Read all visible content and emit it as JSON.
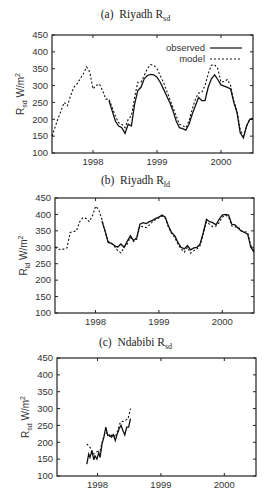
{
  "figure": {
    "panels": [
      {
        "id": "a",
        "label": "(a)",
        "site": "Riyadh",
        "var_main": "R",
        "var_sub": "sd"
      },
      {
        "id": "b",
        "label": "(b)",
        "site": "Riyadh",
        "var_main": "R",
        "var_sub": "ld"
      },
      {
        "id": "c",
        "label": "(c)",
        "site": "Ndabibi",
        "var_main": "R",
        "var_sub": "sd"
      }
    ],
    "legend": {
      "observed": "observed",
      "model": "model"
    },
    "ylabel_units": "W/m",
    "ylabel_sup": "2"
  },
  "chart_data": [
    {
      "type": "line",
      "title": "(a) Riyadh Rsd",
      "xlabel": "",
      "ylabel": "Rsd W/m2",
      "xlim": [
        1997.36,
        2000.5
      ],
      "ylim": [
        100,
        450
      ],
      "xticks": [
        1998,
        1999,
        2000
      ],
      "yticks": [
        100,
        150,
        200,
        250,
        300,
        350,
        400,
        450
      ],
      "grid": false,
      "legend_position": "upper right",
      "series": [
        {
          "name": "observed",
          "style": "solid",
          "x": [
            1998.25,
            1998.3,
            1998.35,
            1998.4,
            1998.45,
            1998.5,
            1998.55,
            1998.6,
            1998.65,
            1998.7,
            1998.75,
            1998.8,
            1998.85,
            1998.9,
            1998.95,
            1999.0,
            1999.05,
            1999.1,
            1999.15,
            1999.2,
            1999.25,
            1999.3,
            1999.35,
            1999.4,
            1999.45,
            1999.5,
            1999.55,
            1999.6,
            1999.65,
            1999.7,
            1999.75,
            1999.8,
            1999.85,
            1999.9,
            1999.95,
            2000.0,
            2000.05,
            2000.1,
            2000.15,
            2000.2,
            2000.25,
            2000.3,
            2000.35,
            2000.4,
            2000.45,
            2000.5
          ],
          "y": [
            255,
            225,
            195,
            180,
            175,
            158,
            185,
            180,
            245,
            285,
            295,
            320,
            330,
            333,
            332,
            325,
            310,
            290,
            270,
            250,
            225,
            195,
            175,
            172,
            168,
            185,
            215,
            240,
            265,
            255,
            255,
            295,
            320,
            332,
            318,
            302,
            298,
            295,
            290,
            250,
            220,
            160,
            145,
            180,
            200,
            202
          ]
        },
        {
          "name": "model",
          "style": "dashed",
          "x": [
            1997.36,
            1997.45,
            1997.55,
            1997.6,
            1997.65,
            1997.7,
            1997.75,
            1997.8,
            1997.85,
            1997.9,
            1997.95,
            1998.0,
            1998.05,
            1998.1,
            1998.15,
            1998.2,
            1998.25,
            1998.3,
            1998.35,
            1998.4,
            1998.45,
            1998.5,
            1998.55,
            1998.6,
            1998.65,
            1998.7,
            1998.75,
            1998.8,
            1998.85,
            1998.9,
            1998.95,
            1999.0,
            1999.05,
            1999.1,
            1999.15,
            1999.2,
            1999.25,
            1999.3,
            1999.35,
            1999.4,
            1999.45,
            1999.5,
            1999.55,
            1999.6,
            1999.65,
            1999.7,
            1999.75,
            1999.8,
            1999.85,
            1999.9,
            1999.95,
            2000.0,
            2000.05,
            2000.1,
            2000.15,
            2000.2,
            2000.25,
            2000.3,
            2000.35,
            2000.4,
            2000.45,
            2000.5
          ],
          "y": [
            150,
            200,
            250,
            240,
            270,
            295,
            305,
            320,
            335,
            355,
            340,
            290,
            300,
            305,
            285,
            260,
            260,
            235,
            210,
            190,
            185,
            175,
            200,
            210,
            265,
            310,
            310,
            330,
            350,
            362,
            360,
            350,
            330,
            310,
            285,
            260,
            235,
            210,
            185,
            182,
            175,
            195,
            230,
            260,
            278,
            280,
            300,
            335,
            360,
            362,
            350,
            310,
            312,
            318,
            300,
            255,
            225,
            170,
            150,
            180,
            200,
            202
          ]
        }
      ]
    },
    {
      "type": "line",
      "title": "(b) Riyadh Rld",
      "xlabel": "",
      "ylabel": "Rld W/m2",
      "xlim": [
        1997.36,
        2000.5
      ],
      "ylim": [
        100,
        450
      ],
      "xticks": [
        1998,
        1999,
        2000
      ],
      "yticks": [
        100,
        150,
        200,
        250,
        300,
        350,
        400,
        450
      ],
      "grid": false,
      "series": [
        {
          "name": "observed",
          "style": "solid",
          "x": [
            1998.1,
            1998.15,
            1998.2,
            1998.25,
            1998.3,
            1998.35,
            1998.4,
            1998.45,
            1998.5,
            1998.55,
            1998.6,
            1998.65,
            1998.7,
            1998.75,
            1998.8,
            1998.85,
            1998.9,
            1998.95,
            1999.0,
            1999.05,
            1999.1,
            1999.15,
            1999.2,
            1999.25,
            1999.3,
            1999.35,
            1999.4,
            1999.45,
            1999.5,
            1999.55,
            1999.6,
            1999.65,
            1999.7,
            1999.75,
            1999.8,
            1999.85,
            1999.9,
            1999.95,
            2000.0,
            2000.05,
            2000.1,
            2000.15,
            2000.2,
            2000.25,
            2000.3,
            2000.35,
            2000.4,
            2000.45,
            2000.5
          ],
          "y": [
            380,
            350,
            315,
            312,
            305,
            300,
            310,
            300,
            318,
            335,
            320,
            330,
            370,
            375,
            372,
            378,
            382,
            388,
            392,
            398,
            392,
            365,
            345,
            335,
            315,
            300,
            295,
            305,
            292,
            298,
            300,
            310,
            345,
            385,
            378,
            375,
            368,
            385,
            398,
            400,
            398,
            370,
            368,
            358,
            350,
            345,
            340,
            300,
            285
          ]
        },
        {
          "name": "model",
          "style": "dashed",
          "x": [
            1997.36,
            1997.45,
            1997.5,
            1997.55,
            1997.6,
            1997.65,
            1997.7,
            1997.75,
            1997.8,
            1997.85,
            1997.9,
            1997.95,
            1998.0,
            1998.05,
            1998.1,
            1998.15,
            1998.2,
            1998.25,
            1998.3,
            1998.35,
            1998.4,
            1998.45,
            1998.5,
            1998.55,
            1998.6,
            1998.65,
            1998.7,
            1998.75,
            1998.8,
            1998.85,
            1998.9,
            1998.95,
            1999.0,
            1999.05,
            1999.1,
            1999.15,
            1999.2,
            1999.25,
            1999.3,
            1999.35,
            1999.4,
            1999.45,
            1999.5,
            1999.55,
            1999.6,
            1999.65,
            1999.7,
            1999.75,
            1999.8,
            1999.85,
            1999.9,
            1999.95,
            2000.0,
            2000.05,
            2000.1,
            2000.15,
            2000.2,
            2000.25,
            2000.3,
            2000.35,
            2000.4,
            2000.45,
            2000.5
          ],
          "y": [
            300,
            292,
            295,
            298,
            345,
            348,
            350,
            378,
            390,
            388,
            378,
            395,
            425,
            415,
            385,
            345,
            318,
            312,
            302,
            290,
            283,
            300,
            310,
            330,
            318,
            325,
            365,
            362,
            360,
            368,
            378,
            385,
            390,
            395,
            388,
            362,
            342,
            330,
            310,
            295,
            285,
            300,
            282,
            290,
            295,
            305,
            340,
            378,
            370,
            362,
            365,
            375,
            392,
            398,
            392,
            365,
            362,
            362,
            350,
            348,
            345,
            305,
            290
          ]
        }
      ]
    },
    {
      "type": "line",
      "title": "(c) Ndabibi Rsd",
      "xlabel": "",
      "ylabel": "Rsd W/m2",
      "xlim": [
        1997.36,
        2000.5
      ],
      "ylim": [
        100,
        450
      ],
      "xticks": [
        1998,
        1999,
        2000
      ],
      "yticks": [
        100,
        150,
        200,
        250,
        300,
        350,
        400,
        450
      ],
      "grid": false,
      "series": [
        {
          "name": "observed",
          "style": "solid",
          "x": [
            1997.83,
            1997.86,
            1997.88,
            1997.91,
            1997.94,
            1997.96,
            1997.99,
            1998.02,
            1998.04,
            1998.07,
            1998.1,
            1998.13,
            1998.16,
            1998.19,
            1998.22,
            1998.25,
            1998.28,
            1998.31,
            1998.34,
            1998.37,
            1998.4,
            1998.43,
            1998.46,
            1998.49,
            1998.52
          ],
          "y": [
            135,
            165,
            155,
            175,
            148,
            160,
            150,
            170,
            155,
            195,
            215,
            245,
            220,
            222,
            215,
            222,
            205,
            225,
            240,
            250,
            235,
            222,
            245,
            245,
            270
          ]
        },
        {
          "name": "model",
          "style": "dashed",
          "x": [
            1997.83,
            1997.86,
            1997.9,
            1997.93,
            1997.96,
            2000.0,
            1998.04,
            1998.08,
            1998.12,
            1998.16,
            1998.2,
            1998.24,
            1998.28,
            1998.32,
            1998.36,
            1998.4,
            1998.44,
            1998.48,
            1998.52
          ],
          "y": [
            195,
            190,
            180,
            165,
            170,
            0,
            175,
            205,
            230,
            225,
            215,
            225,
            215,
            235,
            260,
            262,
            265,
            270,
            300
          ]
        }
      ]
    }
  ]
}
